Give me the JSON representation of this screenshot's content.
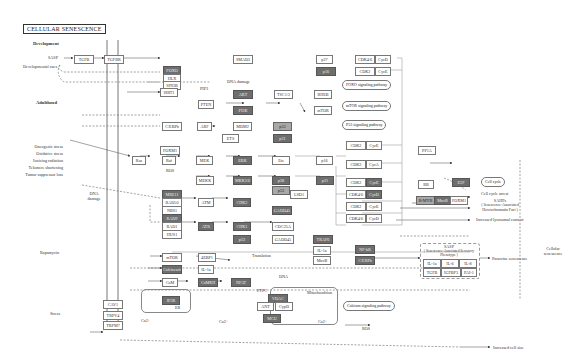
{
  "title": "CELLULAR SENESCENCE",
  "sections": {
    "development": "Development",
    "adulthood": "Adulthood"
  },
  "inputs": {
    "sasp": "SASP",
    "developmental_cues": "Developmental cues",
    "stresses": [
      "Oncogenic stress",
      "Oxidative stress",
      "Ionizing radiation",
      "Telomere shortening",
      "Tumor suppressor loss"
    ],
    "dna_damage": "DNA damage",
    "rapamycin": "Rapamycin",
    "stress": "Stress"
  },
  "inline_labels": {
    "dna_damage_mid": "DNA damage",
    "ros_top": "ROS",
    "ros_bottom": "ROS",
    "pip3": "PIP3",
    "translation": "Translation",
    "ca_left": "Ca2+",
    "ca_mid": "Ca2+",
    "ca_mito": "Ca2+",
    "ptpc": "PTPC",
    "mitochondrion": "Mitochondrion",
    "dna_small": "DNA",
    "p": "+p",
    "er": "ER"
  },
  "pathways": {
    "foxo": "FOXO signaling pathway",
    "mtor": "mTOR signaling pathway",
    "p53": "P53 signaling pathway",
    "cell_cycle": "Cell cycle",
    "calcium": "Calcium signaling pathway"
  },
  "outcomes": {
    "cell_cycle_arrest": "Cell cycle arrest",
    "sahf": "SAHFs",
    "sahf_sub": "( Senescence-Associated Heterochromatin Foci )",
    "lysosomal": "Increased lysosomal content",
    "sasp_title": "SASP",
    "sasp_sub": "( Senescence-Associated Secretory Phenotype )",
    "paracrine": "Paracrine senescence",
    "cell_size": "Increased cell size",
    "cellular_senescence": "Cellular senescence"
  },
  "nodes": {
    "tgfb": "TGFB",
    "tgfbr": "TGFBR",
    "smad3": "SMAD3",
    "foxo": "FOXO",
    "hlx": "HLX",
    "sin3b": "SIN3B",
    "cd256": "CD256",
    "p27_top": "p27",
    "cdk2_cyce_top": "CDK2",
    "cyce_top": "CycE",
    "cdk46_top": "CDK4/6",
    "cycd_top": "CycD",
    "pi3k": "PI3K",
    "pten": "PTEN",
    "akt": "AKT",
    "tsc12": "TSC1/2",
    "rheb": "RHEB",
    "mtor_node": "mTOR",
    "sirt1": "SIRT1",
    "cebpb": "C/EBPb",
    "arf": "ARF",
    "mdm2": "MDM2",
    "p53_top": "p53",
    "foxm1": "FOXM1",
    "ets": "ETS",
    "ras": "Ras",
    "raf": "Raf",
    "mek": "MEK",
    "erk": "ERK",
    "ets2": "Ets",
    "p16": "p16",
    "mekk": "MEKK",
    "mkk36": "MKK3/6",
    "p38": "p38",
    "p53_mid": "p53",
    "p21": "p21",
    "lsd1": "LSD1",
    "mre11": "MRE11",
    "rad50": "RAD50",
    "nbs1": "NBS1",
    "atm": "ATM",
    "chk2": "CHK2",
    "rad9": "RAD9",
    "rad1": "RAD1",
    "hus1": "HUS1",
    "atr": "ATR",
    "chk1": "CHK1",
    "cdc25a": "CDC25A",
    "p53_low": "p53",
    "gadd45": "GADD45",
    "trafs": "TRAF6",
    "il1a": "IL-1a",
    "nfkb": "NF-kB",
    "mtor_low": "mTOR",
    "4ebp1": "4EBP1",
    "il1a_low": "IL-1a",
    "calcineurin": "Calcineurin",
    "nfat": "NFAT",
    "cam": "CaM",
    "camkii": "CaMKII",
    "cebpb_low": "C/EBPb",
    "ip3r": "IP3R",
    "vdac": "VDAC",
    "ant": "ANT",
    "cypd": "CypD",
    "mcu": "MCU",
    "cav1": "CAV1",
    "trpv4": "TRPV4",
    "trpm7": "TRPM7",
    "rb": "RB",
    "e2f": "E2F",
    "b_myb": "B-MYB",
    "mmb": "MuvB",
    "foxm1_r": "FOXM1",
    "ppp1": "PP1A",
    "cdk2_a": "CDK2",
    "cyce_a": "CycE",
    "cdk2_b": "CDK2",
    "cyca_b": "CycA",
    "cdk2_c": "CDK2",
    "cyce_c": "CycE",
    "cdk46_d": "CDK4/6",
    "cycd_d": "CycD",
    "cdk2_e": "CDK2",
    "cyce_e": "CycE",
    "cdk46_f": "CDK4/6",
    "cycd_f": "CycD",
    "sasp_il1a": "IL-1a",
    "sasp_il6": "IL-6",
    "sasp_il8": "IL-8",
    "sasp_tgfb": "TGFB",
    "sasp_igfbp3": "IGFBP3",
    "sasp_pai1": "PAI-1"
  }
}
